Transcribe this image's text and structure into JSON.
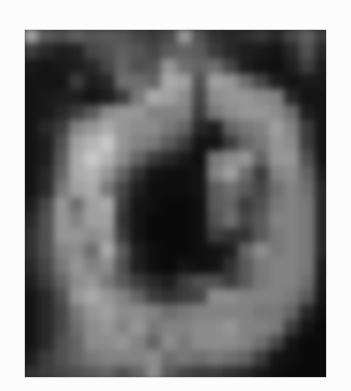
{
  "image": {
    "description": "Grayscale pixelated short-axis cross-section showing a bright ring with a dark center",
    "grid": {
      "cols": 20,
      "rows": 23,
      "values": [
        [
          160,
          90,
          80,
          95,
          85,
          90,
          85,
          70,
          60,
          75,
          150,
          80,
          50,
          40,
          45,
          55,
          40,
          70,
          95,
          60
        ],
        [
          60,
          40,
          30,
          35,
          70,
          80,
          95,
          85,
          70,
          90,
          100,
          90,
          60,
          40,
          30,
          25,
          20,
          40,
          80,
          40
        ],
        [
          25,
          20,
          25,
          30,
          40,
          70,
          100,
          80,
          85,
          150,
          110,
          100,
          110,
          70,
          30,
          20,
          15,
          30,
          60,
          30
        ],
        [
          20,
          20,
          20,
          60,
          30,
          40,
          110,
          110,
          100,
          170,
          160,
          80,
          160,
          150,
          110,
          70,
          30,
          20,
          25,
          25
        ],
        [
          20,
          25,
          30,
          30,
          20,
          30,
          60,
          120,
          170,
          160,
          140,
          70,
          140,
          150,
          150,
          140,
          130,
          40,
          20,
          20
        ],
        [
          20,
          25,
          40,
          60,
          90,
          140,
          150,
          150,
          130,
          130,
          130,
          60,
          120,
          140,
          150,
          150,
          140,
          110,
          30,
          20
        ],
        [
          20,
          40,
          60,
          130,
          150,
          170,
          150,
          140,
          140,
          120,
          100,
          40,
          30,
          100,
          120,
          130,
          160,
          130,
          60,
          20
        ],
        [
          20,
          30,
          80,
          160,
          180,
          200,
          150,
          130,
          120,
          90,
          60,
          20,
          20,
          60,
          100,
          120,
          150,
          140,
          60,
          20
        ],
        [
          20,
          30,
          90,
          170,
          200,
          180,
          140,
          100,
          60,
          40,
          25,
          15,
          120,
          140,
          150,
          100,
          150,
          150,
          80,
          20
        ],
        [
          20,
          40,
          100,
          170,
          180,
          150,
          100,
          50,
          20,
          15,
          15,
          20,
          130,
          160,
          110,
          60,
          130,
          140,
          100,
          30
        ],
        [
          20,
          40,
          120,
          160,
          170,
          120,
          70,
          30,
          15,
          15,
          15,
          20,
          90,
          110,
          90,
          70,
          110,
          130,
          110,
          40
        ],
        [
          30,
          70,
          150,
          110,
          160,
          170,
          60,
          20,
          15,
          10,
          10,
          15,
          90,
          100,
          60,
          80,
          120,
          130,
          120,
          40
        ],
        [
          40,
          80,
          150,
          130,
          160,
          160,
          50,
          20,
          10,
          10,
          10,
          15,
          80,
          110,
          70,
          90,
          130,
          130,
          120,
          40
        ],
        [
          50,
          80,
          150,
          150,
          140,
          150,
          60,
          20,
          10,
          10,
          10,
          15,
          60,
          50,
          50,
          90,
          120,
          130,
          120,
          40
        ],
        [
          50,
          80,
          130,
          140,
          110,
          170,
          90,
          30,
          15,
          10,
          10,
          15,
          20,
          30,
          100,
          140,
          120,
          130,
          120,
          40
        ],
        [
          40,
          70,
          120,
          150,
          130,
          140,
          80,
          30,
          15,
          10,
          20,
          15,
          20,
          50,
          90,
          120,
          130,
          130,
          120,
          30
        ],
        [
          30,
          60,
          100,
          140,
          150,
          120,
          90,
          60,
          40,
          30,
          60,
          80,
          80,
          60,
          90,
          120,
          130,
          130,
          110,
          25
        ],
        [
          20,
          40,
          80,
          150,
          170,
          150,
          130,
          100,
          60,
          50,
          60,
          70,
          140,
          140,
          130,
          130,
          130,
          120,
          90,
          20
        ],
        [
          20,
          40,
          70,
          120,
          150,
          160,
          140,
          140,
          130,
          110,
          120,
          130,
          130,
          130,
          130,
          120,
          120,
          100,
          40,
          15
        ],
        [
          20,
          40,
          70,
          110,
          140,
          150,
          130,
          150,
          120,
          130,
          130,
          140,
          140,
          150,
          130,
          130,
          120,
          60,
          20,
          10
        ],
        [
          20,
          40,
          80,
          100,
          140,
          140,
          150,
          130,
          100,
          140,
          120,
          140,
          140,
          140,
          130,
          110,
          70,
          20,
          10,
          10
        ],
        [
          30,
          60,
          80,
          100,
          120,
          130,
          130,
          130,
          140,
          110,
          120,
          110,
          120,
          110,
          100,
          60,
          20,
          15,
          10,
          10
        ],
        [
          50,
          60,
          70,
          80,
          90,
          100,
          80,
          100,
          140,
          90,
          70,
          60,
          60,
          50,
          40,
          25,
          15,
          10,
          10,
          10
        ]
      ]
    }
  }
}
